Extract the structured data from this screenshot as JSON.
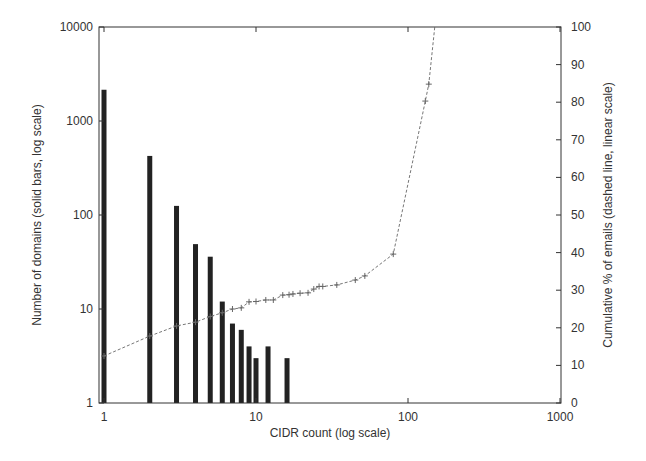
{
  "chart_data": {
    "type": "bar",
    "title": "",
    "xlabel": "CIDR count (log scale)",
    "ylabel": "Number of domains (solid bars, log scale)",
    "y2label": "Cumulative % of emails (dashed line, linear scale)",
    "xscale": "log",
    "yscale": "log",
    "y2scale": "linear",
    "xlim": [
      1,
      1000
    ],
    "ylim": [
      1,
      10000
    ],
    "y2lim": [
      0,
      100
    ],
    "grid": false,
    "legend": null,
    "x_ticks": [
      "1",
      "10",
      "100",
      "1000"
    ],
    "y_ticks": [
      "1",
      "10",
      "100",
      "1000",
      "10000"
    ],
    "y2_ticks": [
      "0",
      "10",
      "20",
      "30",
      "40",
      "50",
      "60",
      "70",
      "80",
      "90",
      "100"
    ],
    "series": [
      {
        "name": "Number of domains",
        "type": "bar",
        "axis": "left",
        "x": [
          1,
          2,
          3,
          4,
          5,
          6,
          7,
          8,
          9,
          10,
          12,
          16
        ],
        "values": [
          2150,
          425,
          125,
          49,
          36,
          12,
          7,
          6,
          4,
          3,
          4,
          3
        ]
      },
      {
        "name": "Cumulative % of emails",
        "type": "line",
        "style": "dashed",
        "axis": "right",
        "x": [
          1,
          2,
          3,
          4,
          5,
          6,
          7,
          8,
          9,
          10,
          11.6,
          13,
          15,
          16.5,
          17.5,
          19.5,
          22,
          24,
          26,
          27.5,
          34,
          45,
          52,
          80,
          130,
          137,
          150
        ],
        "values": [
          12.5,
          17.8,
          20.5,
          21.5,
          23,
          24,
          25,
          25.3,
          26.9,
          27,
          27.4,
          27.4,
          28.7,
          28.8,
          29,
          29.2,
          29.3,
          30.3,
          31,
          31,
          31.4,
          32.7,
          33.8,
          39.6,
          80.3,
          84.8,
          100
        ]
      }
    ]
  }
}
